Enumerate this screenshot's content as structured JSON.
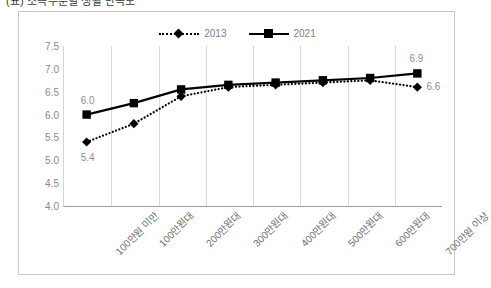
{
  "caption": {
    "text": "(표) 소득수준별 생활 만족도"
  },
  "chart_data": {
    "type": "line",
    "title": "",
    "subtitle": "",
    "xlabel": "",
    "ylabel": "",
    "ylim": [
      4.0,
      7.5
    ],
    "ytick_labels": [
      "7.5",
      "7.0",
      "6.5",
      "6.0",
      "5.5",
      "5.0",
      "4.5",
      "4.0"
    ],
    "ytick_values": [
      7.5,
      7.0,
      6.5,
      6.0,
      5.5,
      5.0,
      4.5,
      4.0
    ],
    "grid": "vertical-only",
    "legend_position": "top-center",
    "categories": [
      "100만원 미만",
      "100만원대",
      "200만원대",
      "300만원대",
      "400만원대",
      "500만원대",
      "600만원대",
      "700만원 이상"
    ],
    "series": [
      {
        "name": "2013",
        "style": "dotted",
        "marker": "diamond",
        "color": "#000000",
        "values": [
          5.4,
          5.8,
          6.4,
          6.6,
          6.65,
          6.7,
          6.75,
          6.6
        ]
      },
      {
        "name": "2021",
        "style": "solid",
        "marker": "square",
        "color": "#000000",
        "values": [
          6.0,
          6.25,
          6.55,
          6.65,
          6.7,
          6.75,
          6.8,
          6.9
        ]
      }
    ],
    "point_labels": [
      {
        "series": "2021",
        "category_index": 0,
        "text": "6.0"
      },
      {
        "series": "2013",
        "category_index": 0,
        "text": "5.4"
      },
      {
        "series": "2021",
        "category_index": 7,
        "text": "6.9"
      },
      {
        "series": "2013",
        "category_index": 7,
        "text": "6.6"
      }
    ]
  }
}
